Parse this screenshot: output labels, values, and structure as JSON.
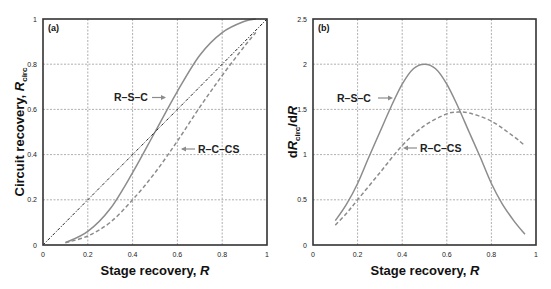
{
  "chart_data": [
    {
      "type": "line",
      "panel": "(a)",
      "title": "",
      "xlabel": "Stage recovery, R",
      "ylabel": "Circuit recovery, R_circ",
      "xlim": [
        0,
        1
      ],
      "ylim": [
        0,
        1
      ],
      "xticks": [
        "0",
        "0.2",
        "0.4",
        "0.6",
        "0.8",
        "1"
      ],
      "yticks": [
        "0",
        "0.2",
        "0.4",
        "0.6",
        "0.8",
        "1"
      ],
      "grid": true,
      "legend": "inline annotations with arrows",
      "series": [
        {
          "name": "R-S-C",
          "style": "solid",
          "color": "#8c8c8c",
          "x": [
            0.1,
            0.2,
            0.3,
            0.4,
            0.5,
            0.6,
            0.7,
            0.8,
            0.9,
            0.95
          ],
          "y": [
            0.01,
            0.06,
            0.16,
            0.32,
            0.5,
            0.68,
            0.84,
            0.94,
            0.99,
            1.0
          ]
        },
        {
          "name": "R-C-CS",
          "style": "dashed",
          "color": "#8c8c8c",
          "x": [
            0.1,
            0.2,
            0.3,
            0.4,
            0.5,
            0.6,
            0.7,
            0.8,
            0.9,
            0.95
          ],
          "y": [
            0.01,
            0.04,
            0.1,
            0.2,
            0.32,
            0.46,
            0.61,
            0.75,
            0.88,
            0.94
          ]
        },
        {
          "name": "diagonal",
          "style": "dash-dot",
          "color": "#222222",
          "x": [
            0,
            1
          ],
          "y": [
            0,
            1
          ]
        }
      ],
      "annotations": [
        {
          "text": "R–S–C",
          "arrow": "right"
        },
        {
          "text": "R–C–CS",
          "arrow": "left"
        }
      ]
    },
    {
      "type": "line",
      "panel": "(b)",
      "title": "",
      "xlabel": "Stage recovery, R",
      "ylabel": "dR_circ/dR",
      "xlim": [
        0,
        1
      ],
      "ylim": [
        0,
        2.5
      ],
      "xticks": [
        "0",
        "0.2",
        "0.4",
        "0.6",
        "0.8",
        "1"
      ],
      "yticks": [
        "0",
        "0.5",
        "1",
        "1.5",
        "2",
        "2.5"
      ],
      "grid": true,
      "legend": "inline annotations with arrows",
      "series": [
        {
          "name": "R-S-C",
          "style": "solid",
          "color": "#8c8c8c",
          "x": [
            0.1,
            0.15,
            0.2,
            0.25,
            0.3,
            0.35,
            0.4,
            0.45,
            0.5,
            0.55,
            0.6,
            0.65,
            0.7,
            0.75,
            0.8,
            0.85,
            0.9,
            0.95
          ],
          "y": [
            0.27,
            0.45,
            0.68,
            0.97,
            1.25,
            1.53,
            1.78,
            1.95,
            2.0,
            1.95,
            1.78,
            1.53,
            1.25,
            0.97,
            0.68,
            0.45,
            0.27,
            0.12
          ]
        },
        {
          "name": "R-C-CS",
          "style": "dashed",
          "color": "#8c8c8c",
          "x": [
            0.1,
            0.15,
            0.2,
            0.3,
            0.4,
            0.5,
            0.6,
            0.65,
            0.7,
            0.8,
            0.9,
            0.95
          ],
          "y": [
            0.22,
            0.35,
            0.5,
            0.8,
            1.1,
            1.32,
            1.45,
            1.47,
            1.46,
            1.37,
            1.2,
            1.1
          ]
        }
      ],
      "annotations": [
        {
          "text": "R–S–C",
          "arrow": "right"
        },
        {
          "text": "R–C–CS",
          "arrow": "left"
        }
      ]
    }
  ],
  "panels": {
    "a": {
      "label": "(a)",
      "xlabel_text": "Stage recovery, ",
      "xlabel_var": "R",
      "ylabel_text": "Circuit recovery, ",
      "ylabel_var": "R",
      "ylabel_sub": "circ",
      "rsc_label": "R–S–C",
      "rccs_label": "R–C–CS",
      "xticks": [
        "0",
        "0.2",
        "0.4",
        "0.6",
        "0.8",
        "1"
      ],
      "yticks": [
        "0",
        "0.2",
        "0.4",
        "0.6",
        "0.8",
        "1"
      ]
    },
    "b": {
      "label": "(b)",
      "xlabel_text": "Stage recovery, ",
      "xlabel_var": "R",
      "ylabel_pre": "d",
      "ylabel_var": "R",
      "ylabel_sub": "circ",
      "ylabel_post": "/d",
      "ylabel_var2": "R",
      "rsc_label": "R–S–C",
      "rccs_label": "R–C–CS",
      "xticks": [
        "0",
        "0.2",
        "0.4",
        "0.6",
        "0.8",
        "1"
      ],
      "yticks": [
        "0",
        "0.5",
        "1",
        "1.5",
        "2",
        "2.5"
      ]
    }
  },
  "colors": {
    "curve": "#8c8c8c",
    "diagonal": "#222222",
    "grid": "#9a9a9a",
    "frame": "#333333",
    "arrow": "#8c8c8c"
  }
}
